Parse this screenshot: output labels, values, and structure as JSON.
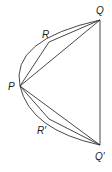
{
  "diagram": {
    "labels": {
      "Q": "Q",
      "R": "R",
      "P": "P",
      "R_prime": "R′",
      "Q_prime": "Q′"
    },
    "points": {
      "Q": [
        100,
        20
      ],
      "R": [
        49,
        42
      ],
      "P": [
        20,
        86
      ],
      "R_prime": [
        49,
        119
      ],
      "Q_prime": [
        100,
        145
      ]
    },
    "stroke_color": "#333333"
  }
}
